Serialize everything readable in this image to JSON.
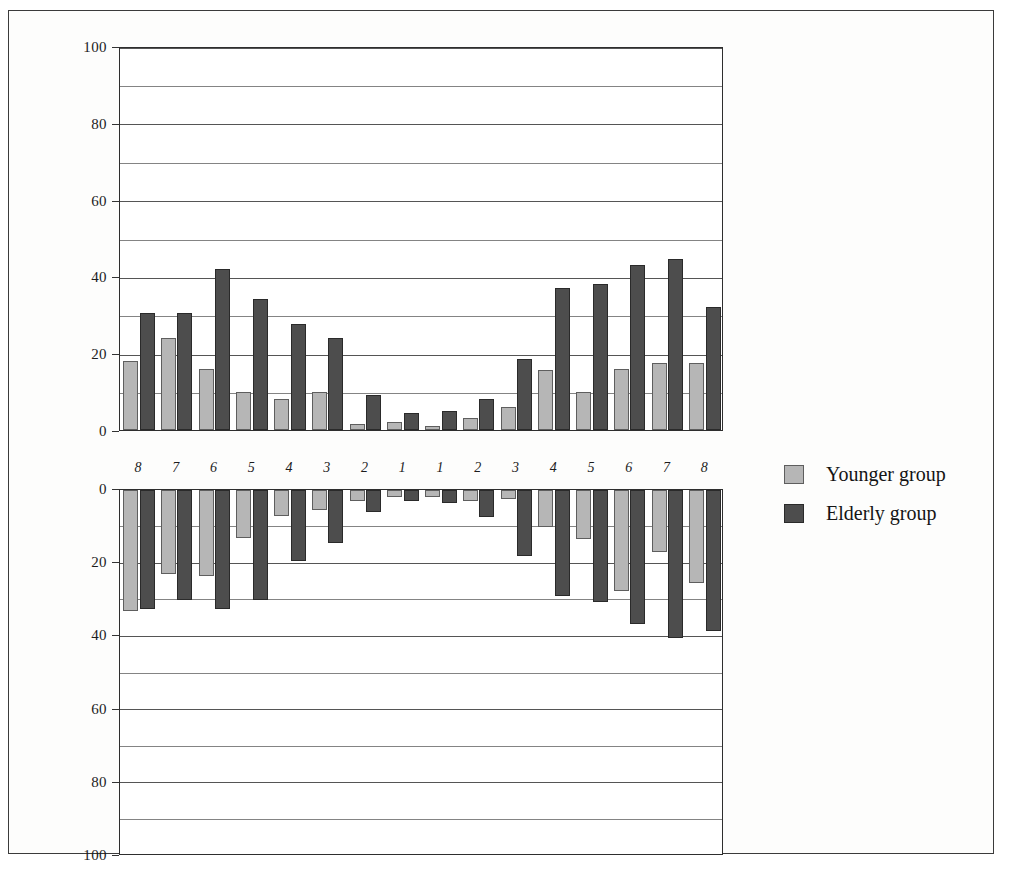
{
  "chart_data": {
    "type": "bar",
    "title": "",
    "subtitle": "",
    "xlabel": "",
    "ylabel": "",
    "grid": true,
    "legend_position": "right",
    "panels": [
      {
        "name": "upper-panel",
        "direction": "up",
        "ylim": [
          0,
          100
        ],
        "yticks": [
          0,
          20,
          40,
          60,
          80,
          100
        ],
        "ytick_labels": [
          "0",
          "20",
          "40",
          "60",
          "80",
          "100"
        ],
        "minor_gridlines": [
          10,
          30,
          50,
          70,
          90
        ],
        "categories": [
          "8",
          "7",
          "6",
          "5",
          "4",
          "3",
          "2",
          "1",
          "1",
          "2",
          "3",
          "4",
          "5",
          "6",
          "7",
          "8"
        ],
        "series": [
          {
            "name": "Younger group",
            "color": "#b6b6b6",
            "values": [
              18,
              24,
              16,
              10,
              8,
              10,
              1.5,
              2,
              1,
              3,
              6,
              15.5,
              10,
              16,
              17.5,
              17.5
            ]
          },
          {
            "name": "Elderly group",
            "color": "#4d4d4d",
            "values": [
              30.5,
              30.5,
              42,
              34,
              27.5,
              24,
              9,
              4.5,
              5,
              8,
              18.5,
              37,
              38,
              43,
              44.5,
              32
            ]
          }
        ]
      },
      {
        "name": "lower-panel",
        "direction": "down",
        "ylim": [
          0,
          100
        ],
        "yticks": [
          0,
          20,
          40,
          60,
          80,
          100
        ],
        "ytick_labels": [
          "0",
          "20",
          "40",
          "60",
          "80",
          "100"
        ],
        "minor_gridlines": [
          10,
          30,
          50,
          70,
          90
        ],
        "categories": [
          "8",
          "7",
          "6",
          "5",
          "4",
          "3",
          "2",
          "1",
          "1",
          "2",
          "3",
          "4",
          "5",
          "6",
          "7",
          "8"
        ],
        "series": [
          {
            "name": "Younger group",
            "color": "#b6b6b6",
            "values": [
              33,
              23,
              23.5,
              13,
              7,
              5.5,
              3,
              2,
              2,
              3,
              2.5,
              10,
              13.5,
              27.5,
              17,
              25.5
            ]
          },
          {
            "name": "Elderly group",
            "color": "#4d4d4d",
            "values": [
              32.5,
              30,
              32.5,
              30,
              19.5,
              14.5,
              6,
              3,
              3.5,
              7.5,
              18,
              29,
              30.5,
              36.5,
              40.5,
              38.5
            ]
          }
        ]
      }
    ]
  },
  "legend": {
    "items": [
      {
        "label": "Younger group",
        "swatch": "young-swatch",
        "color": "#b6b6b6"
      },
      {
        "label": "Elderly group",
        "swatch": "elderly-swatch",
        "color": "#4d4d4d"
      }
    ]
  }
}
